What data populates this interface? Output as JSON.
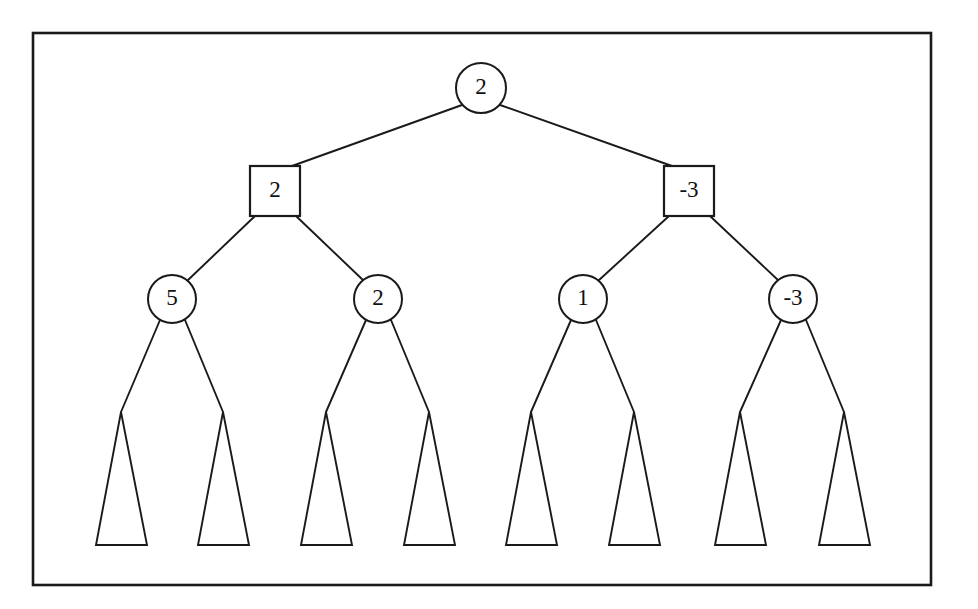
{
  "figure": {
    "background_color": "#ffffff",
    "ink_color": "#1a1a1a",
    "frame": {
      "name": "figure-border",
      "x": 33,
      "y": 33,
      "width": 898,
      "height": 552
    }
  },
  "tree": {
    "levels": [
      {
        "index": 0,
        "node_shape": "circle",
        "role": "max",
        "nodes": [
          {
            "id": "root",
            "label": "2",
            "cx": 481,
            "cy": 88,
            "r": 25
          }
        ]
      },
      {
        "index": 1,
        "node_shape": "square",
        "role": "min",
        "nodes": [
          {
            "id": "n-left",
            "label": "2",
            "cx": 275,
            "cy": 191,
            "size": 50
          },
          {
            "id": "n-right",
            "label": "-3",
            "cx": 689,
            "cy": 191,
            "size": 50
          }
        ]
      },
      {
        "index": 2,
        "node_shape": "circle",
        "role": "max",
        "nodes": [
          {
            "id": "n-ll",
            "label": "5",
            "cx": 172,
            "cy": 299,
            "r": 24
          },
          {
            "id": "n-lr",
            "label": "2",
            "cx": 378,
            "cy": 299,
            "r": 24
          },
          {
            "id": "n-rl",
            "label": "1",
            "cx": 583,
            "cy": 299,
            "r": 24
          },
          {
            "id": "n-rr",
            "label": "-3",
            "cx": 793,
            "cy": 299,
            "r": 24
          }
        ]
      }
    ],
    "subtrees": [
      {
        "id": "t1",
        "label": "",
        "apex_x": 121,
        "apex_y": 412,
        "base_left": 96,
        "base_right": 147,
        "base_y": 545
      },
      {
        "id": "t2",
        "label": "",
        "apex_x": 223,
        "apex_y": 412,
        "base_left": 198,
        "base_right": 249,
        "base_y": 545
      },
      {
        "id": "t3",
        "label": "",
        "apex_x": 326,
        "apex_y": 412,
        "base_left": 301,
        "base_right": 352,
        "base_y": 545
      },
      {
        "id": "t4",
        "label": "",
        "apex_x": 429,
        "apex_y": 412,
        "base_left": 404,
        "base_right": 455,
        "base_y": 545
      },
      {
        "id": "t5",
        "label": "",
        "apex_x": 531,
        "apex_y": 412,
        "base_left": 506,
        "base_right": 557,
        "base_y": 545
      },
      {
        "id": "t6",
        "label": "",
        "apex_x": 634,
        "apex_y": 412,
        "base_left": 609,
        "base_right": 660,
        "base_y": 545
      },
      {
        "id": "t7",
        "label": "",
        "apex_x": 740,
        "apex_y": 412,
        "base_left": 715,
        "base_right": 766,
        "base_y": 545
      },
      {
        "id": "t8",
        "label": "",
        "apex_x": 844,
        "apex_y": 412,
        "base_left": 819,
        "base_right": 870,
        "base_y": 545
      }
    ],
    "edges": [
      {
        "id": "e-root-left",
        "from": "root",
        "to": "n-left",
        "x1": 462,
        "y1": 105,
        "x2": 292,
        "y2": 166
      },
      {
        "id": "e-root-right",
        "from": "root",
        "to": "n-right",
        "x1": 500,
        "y1": 105,
        "x2": 672,
        "y2": 166
      },
      {
        "id": "e-left-ll",
        "from": "n-left",
        "to": "n-ll",
        "x1": 255,
        "y1": 216,
        "x2": 187,
        "y2": 281
      },
      {
        "id": "e-left-lr",
        "from": "n-left",
        "to": "n-lr",
        "x1": 296,
        "y1": 216,
        "x2": 364,
        "y2": 281
      },
      {
        "id": "e-right-rl",
        "from": "n-right",
        "to": "n-rl",
        "x1": 669,
        "y1": 216,
        "x2": 598,
        "y2": 281
      },
      {
        "id": "e-right-rr",
        "from": "n-right",
        "to": "n-rr",
        "x1": 710,
        "y1": 216,
        "x2": 779,
        "y2": 281
      },
      {
        "id": "e-ll-t1",
        "from": "n-ll",
        "to": "t1",
        "x1": 160,
        "y1": 320,
        "x2": 121,
        "y2": 412
      },
      {
        "id": "e-ll-t2",
        "from": "n-ll",
        "to": "t2",
        "x1": 185,
        "y1": 320,
        "x2": 223,
        "y2": 412
      },
      {
        "id": "e-lr-t3",
        "from": "n-lr",
        "to": "t3",
        "x1": 366,
        "y1": 320,
        "x2": 326,
        "y2": 412
      },
      {
        "id": "e-lr-t4",
        "from": "n-lr",
        "to": "t4",
        "x1": 391,
        "y1": 320,
        "x2": 429,
        "y2": 412
      },
      {
        "id": "e-rl-t5",
        "from": "n-rl",
        "to": "t5",
        "x1": 571,
        "y1": 320,
        "x2": 531,
        "y2": 412
      },
      {
        "id": "e-rl-t6",
        "from": "n-rl",
        "to": "t6",
        "x1": 596,
        "y1": 320,
        "x2": 634,
        "y2": 412
      },
      {
        "id": "e-rr-t7",
        "from": "n-rr",
        "to": "t7",
        "x1": 781,
        "y1": 320,
        "x2": 740,
        "y2": 412
      },
      {
        "id": "e-rr-t8",
        "from": "n-rr",
        "to": "t8",
        "x1": 806,
        "y1": 320,
        "x2": 844,
        "y2": 412
      }
    ]
  }
}
